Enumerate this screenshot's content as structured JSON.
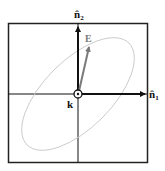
{
  "diagram": {
    "labels": {
      "n1": "n̂",
      "n1_sub": "1",
      "n2": "n̂",
      "n2_sub": "2",
      "E": "E",
      "k": "k"
    },
    "colors": {
      "frame": "#222222",
      "axes": "#111111",
      "ellipse": "#c8c8c8",
      "e_vector": "#7a7a7a",
      "background": "#ffffff"
    },
    "elements": [
      {
        "name": "frame",
        "type": "square-box"
      },
      {
        "name": "n1-axis-arrow",
        "direction": "right"
      },
      {
        "name": "n2-axis-arrow",
        "direction": "up"
      },
      {
        "name": "e-vector-arrow",
        "direction": "up-right"
      },
      {
        "name": "polarization-ellipse",
        "orientation": "tilted ~45°"
      },
      {
        "name": "k-out-of-page-symbol",
        "glyph": "⊙"
      }
    ]
  }
}
